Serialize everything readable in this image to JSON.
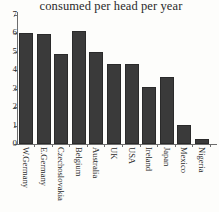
{
  "chart_data": {
    "type": "bar",
    "title": "consumed per head per year",
    "xlabel": "",
    "ylabel": "",
    "ylim": [
      0,
      7
    ],
    "yticks": [
      0,
      1,
      2,
      3,
      4,
      5,
      6,
      7
    ],
    "grid": false,
    "legend": false,
    "categories": [
      "W.Germany",
      "E.Germany",
      "Czechoslovakia",
      "Belgium",
      "Australia",
      "UK",
      "USA",
      "Ireland",
      "Japan",
      "Mexico",
      "Nigeria"
    ],
    "values": [
      6.0,
      5.95,
      4.85,
      6.1,
      5.0,
      4.35,
      4.3,
      3.1,
      3.6,
      1.05,
      0.25
    ],
    "bar_color": "#3a3a3a",
    "axis_color": "#6d6d6d"
  }
}
